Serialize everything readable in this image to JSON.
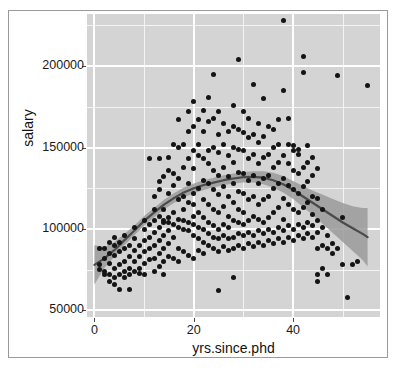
{
  "chart_data": {
    "type": "scatter",
    "title": "",
    "xlabel": "yrs.since.phd",
    "ylabel": "salary",
    "xlim": [
      -1.5,
      57.5
    ],
    "ylim": [
      46000,
      232000
    ],
    "xticks": [
      0,
      20,
      40
    ],
    "xticklabels": [
      "0",
      "20",
      "40"
    ],
    "yticks": [
      50000,
      100000,
      150000,
      200000
    ],
    "yticklabels": [
      "50000",
      "100000",
      "150000",
      "200000"
    ],
    "xminor": [
      10,
      30,
      50
    ],
    "yminor": [
      75000,
      125000,
      175000,
      225000
    ],
    "grid": true,
    "legend": "none",
    "panel_background": "#d4d4d4",
    "grid_color": "#ffffff",
    "point_color": "#141414",
    "smooth_line_color": "#4a4a4a",
    "smooth_band_color": "#9a9a9a",
    "smooth_method": "loess",
    "points": [
      [
        1,
        88000
      ],
      [
        1,
        78000
      ],
      [
        1,
        75000
      ],
      [
        2,
        74000
      ],
      [
        2,
        82000
      ],
      [
        2,
        72000
      ],
      [
        2,
        88000
      ],
      [
        3,
        72000
      ],
      [
        3,
        79000
      ],
      [
        3,
        85000
      ],
      [
        3,
        92000
      ],
      [
        3,
        68000
      ],
      [
        4,
        70000
      ],
      [
        4,
        76000
      ],
      [
        4,
        84000
      ],
      [
        4,
        90000
      ],
      [
        4,
        95000
      ],
      [
        4,
        66000
      ],
      [
        5,
        72000
      ],
      [
        5,
        78000
      ],
      [
        5,
        86000
      ],
      [
        5,
        92000
      ],
      [
        5,
        63000
      ],
      [
        6,
        74000
      ],
      [
        6,
        80000
      ],
      [
        6,
        88000
      ],
      [
        6,
        96000
      ],
      [
        6,
        70000
      ],
      [
        7,
        76000
      ],
      [
        7,
        83000
      ],
      [
        7,
        90000
      ],
      [
        7,
        72000
      ],
      [
        7,
        63000
      ],
      [
        8,
        74000
      ],
      [
        8,
        80000
      ],
      [
        8,
        87000
      ],
      [
        8,
        94000
      ],
      [
        8,
        101000
      ],
      [
        9,
        76000
      ],
      [
        9,
        83000
      ],
      [
        9,
        90000
      ],
      [
        9,
        73000
      ],
      [
        10,
        79000
      ],
      [
        10,
        86000
      ],
      [
        10,
        93000
      ],
      [
        10,
        100000
      ],
      [
        10,
        105000
      ],
      [
        10,
        72000
      ],
      [
        11,
        81000
      ],
      [
        11,
        88000
      ],
      [
        11,
        95000
      ],
      [
        11,
        103000
      ],
      [
        11,
        143000
      ],
      [
        12,
        74000
      ],
      [
        12,
        82000
      ],
      [
        12,
        90000
      ],
      [
        12,
        98000
      ],
      [
        12,
        105000
      ],
      [
        12,
        112000
      ],
      [
        12,
        120000
      ],
      [
        13,
        77000
      ],
      [
        13,
        85000
      ],
      [
        13,
        93000
      ],
      [
        13,
        101000
      ],
      [
        13,
        108000
      ],
      [
        13,
        124000
      ],
      [
        13,
        129000
      ],
      [
        13,
        143000
      ],
      [
        14,
        72000
      ],
      [
        14,
        80000
      ],
      [
        14,
        88000
      ],
      [
        14,
        96000
      ],
      [
        14,
        104000
      ],
      [
        14,
        112000
      ],
      [
        14,
        105000
      ],
      [
        14,
        132000
      ],
      [
        15,
        83000
      ],
      [
        15,
        91000
      ],
      [
        15,
        99000
      ],
      [
        15,
        107000
      ],
      [
        15,
        104000
      ],
      [
        15,
        122000
      ],
      [
        15,
        136000
      ],
      [
        15,
        144000
      ],
      [
        16,
        82000
      ],
      [
        16,
        95000
      ],
      [
        16,
        103000
      ],
      [
        16,
        110000
      ],
      [
        16,
        127000
      ],
      [
        16,
        134000
      ],
      [
        16,
        152000
      ],
      [
        17,
        80000
      ],
      [
        17,
        88000
      ],
      [
        17,
        101000
      ],
      [
        17,
        106000
      ],
      [
        17,
        118000
      ],
      [
        17,
        131000
      ],
      [
        17,
        150000
      ],
      [
        17,
        167000
      ],
      [
        18,
        86000
      ],
      [
        18,
        100000
      ],
      [
        18,
        105000
      ],
      [
        18,
        112000
      ],
      [
        18,
        120000
      ],
      [
        18,
        138000
      ],
      [
        18,
        152000
      ],
      [
        19,
        84000
      ],
      [
        19,
        99000
      ],
      [
        19,
        104000
      ],
      [
        19,
        116000
      ],
      [
        19,
        128000
      ],
      [
        19,
        143000
      ],
      [
        19,
        160000
      ],
      [
        19,
        172000
      ],
      [
        20,
        82000
      ],
      [
        20,
        96000
      ],
      [
        20,
        103000
      ],
      [
        20,
        108000
      ],
      [
        20,
        115000
      ],
      [
        20,
        122000
      ],
      [
        20,
        137000
      ],
      [
        20,
        148000
      ],
      [
        20,
        163000
      ],
      [
        20,
        178000
      ],
      [
        21,
        87000
      ],
      [
        21,
        94000
      ],
      [
        21,
        101000
      ],
      [
        21,
        110000
      ],
      [
        21,
        125000
      ],
      [
        21,
        145000
      ],
      [
        21,
        152000
      ],
      [
        21,
        167000
      ],
      [
        22,
        85000
      ],
      [
        22,
        92000
      ],
      [
        22,
        100000
      ],
      [
        22,
        107000
      ],
      [
        22,
        118000
      ],
      [
        22,
        130000
      ],
      [
        22,
        143000
      ],
      [
        22,
        160000
      ],
      [
        22,
        173000
      ],
      [
        23,
        90000
      ],
      [
        23,
        97000
      ],
      [
        23,
        104000
      ],
      [
        23,
        115000
      ],
      [
        23,
        128000
      ],
      [
        23,
        140000
      ],
      [
        23,
        148000
      ],
      [
        23,
        166000
      ],
      [
        23,
        181000
      ],
      [
        24,
        88000
      ],
      [
        24,
        95000
      ],
      [
        24,
        102000
      ],
      [
        24,
        112000
      ],
      [
        24,
        124000
      ],
      [
        24,
        136000
      ],
      [
        24,
        150000
      ],
      [
        24,
        168000
      ],
      [
        24,
        195000
      ],
      [
        25,
        62000
      ],
      [
        25,
        86000
      ],
      [
        25,
        94000
      ],
      [
        25,
        100000
      ],
      [
        25,
        110000
      ],
      [
        25,
        121000
      ],
      [
        25,
        133000
      ],
      [
        25,
        147000
      ],
      [
        25,
        158000
      ],
      [
        25,
        172000
      ],
      [
        26,
        89000
      ],
      [
        26,
        96000
      ],
      [
        26,
        103000
      ],
      [
        26,
        114000
      ],
      [
        26,
        126000
      ],
      [
        26,
        138000
      ],
      [
        26,
        152000
      ],
      [
        26,
        165000
      ],
      [
        27,
        87000
      ],
      [
        27,
        94000
      ],
      [
        27,
        101000
      ],
      [
        27,
        108000
      ],
      [
        27,
        120000
      ],
      [
        27,
        132000
      ],
      [
        27,
        145000
      ],
      [
        27,
        160000
      ],
      [
        28,
        70000
      ],
      [
        28,
        88000
      ],
      [
        28,
        95000
      ],
      [
        28,
        105000
      ],
      [
        28,
        116000
      ],
      [
        28,
        128000
      ],
      [
        28,
        141000
      ],
      [
        28,
        150000
      ],
      [
        28,
        163000
      ],
      [
        28,
        176000
      ],
      [
        29,
        90000
      ],
      [
        29,
        97000
      ],
      [
        29,
        104000
      ],
      [
        29,
        112000
      ],
      [
        29,
        123000
      ],
      [
        29,
        135000
      ],
      [
        29,
        149000
      ],
      [
        29,
        161000
      ],
      [
        29,
        204000
      ],
      [
        30,
        88000
      ],
      [
        30,
        96000
      ],
      [
        30,
        103000
      ],
      [
        30,
        110000
      ],
      [
        30,
        122000
      ],
      [
        30,
        134000
      ],
      [
        30,
        148000
      ],
      [
        30,
        159000
      ],
      [
        30,
        172000
      ],
      [
        31,
        91000
      ],
      [
        31,
        98000
      ],
      [
        31,
        105000
      ],
      [
        31,
        118000
      ],
      [
        31,
        130000
      ],
      [
        31,
        143000
      ],
      [
        31,
        156000
      ],
      [
        31,
        168000
      ],
      [
        32,
        89000
      ],
      [
        32,
        96000
      ],
      [
        32,
        108000
      ],
      [
        32,
        120000
      ],
      [
        32,
        133000
      ],
      [
        32,
        146000
      ],
      [
        32,
        158000
      ],
      [
        32,
        189000
      ],
      [
        33,
        92000
      ],
      [
        33,
        99000
      ],
      [
        33,
        106000
      ],
      [
        33,
        115000
      ],
      [
        33,
        128000
      ],
      [
        33,
        140000
      ],
      [
        33,
        153000
      ],
      [
        33,
        165000
      ],
      [
        34,
        90000
      ],
      [
        34,
        97000
      ],
      [
        34,
        104000
      ],
      [
        34,
        118000
      ],
      [
        34,
        131000
      ],
      [
        34,
        144000
      ],
      [
        34,
        157000
      ],
      [
        34,
        180000
      ],
      [
        35,
        93000
      ],
      [
        35,
        100000
      ],
      [
        35,
        107000
      ],
      [
        35,
        120000
      ],
      [
        35,
        133000
      ],
      [
        35,
        146000
      ],
      [
        35,
        163000
      ],
      [
        36,
        91000
      ],
      [
        36,
        98000
      ],
      [
        36,
        110000
      ],
      [
        36,
        125000
      ],
      [
        36,
        138000
      ],
      [
        36,
        150000
      ],
      [
        36,
        161000
      ],
      [
        37,
        94000
      ],
      [
        37,
        101000
      ],
      [
        37,
        113000
      ],
      [
        37,
        128000
      ],
      [
        37,
        141000
      ],
      [
        37,
        152000
      ],
      [
        37,
        167000
      ],
      [
        38,
        92000
      ],
      [
        38,
        99000
      ],
      [
        38,
        106000
      ],
      [
        38,
        119000
      ],
      [
        38,
        131000
      ],
      [
        38,
        145000
      ],
      [
        38,
        185000
      ],
      [
        38,
        228000
      ],
      [
        39,
        95000
      ],
      [
        39,
        102000
      ],
      [
        39,
        115000
      ],
      [
        39,
        127000
      ],
      [
        39,
        140000
      ],
      [
        39,
        152000
      ],
      [
        39,
        168000
      ],
      [
        40,
        93000
      ],
      [
        40,
        100000
      ],
      [
        40,
        112000
      ],
      [
        40,
        124000
      ],
      [
        40,
        136000
      ],
      [
        40,
        148000
      ],
      [
        40,
        151000
      ],
      [
        41,
        96000
      ],
      [
        41,
        103000
      ],
      [
        41,
        110000
      ],
      [
        41,
        122000
      ],
      [
        41,
        134000
      ],
      [
        41,
        146000
      ],
      [
        41,
        149000
      ],
      [
        42,
        94000
      ],
      [
        42,
        101000
      ],
      [
        42,
        113000
      ],
      [
        42,
        126000
      ],
      [
        42,
        138000
      ],
      [
        42,
        196000
      ],
      [
        42,
        206000
      ],
      [
        43,
        97000
      ],
      [
        43,
        104000
      ],
      [
        43,
        116000
      ],
      [
        43,
        129000
      ],
      [
        43,
        141000
      ],
      [
        43,
        151000
      ],
      [
        44,
        95000
      ],
      [
        44,
        102000
      ],
      [
        44,
        109000
      ],
      [
        44,
        120000
      ],
      [
        44,
        133000
      ],
      [
        44,
        144000
      ],
      [
        45,
        72000
      ],
      [
        45,
        68000
      ],
      [
        45,
        88000
      ],
      [
        45,
        98000
      ],
      [
        45,
        105000
      ],
      [
        45,
        119000
      ],
      [
        45,
        137000
      ],
      [
        46,
        76000
      ],
      [
        46,
        90000
      ],
      [
        46,
        101000
      ],
      [
        46,
        112000
      ],
      [
        47,
        72000
      ],
      [
        47,
        88000
      ],
      [
        47,
        96000
      ],
      [
        48,
        85000
      ],
      [
        48,
        91000
      ],
      [
        49,
        88000
      ],
      [
        49,
        194000
      ],
      [
        50,
        78000
      ],
      [
        50,
        107000
      ],
      [
        51,
        58000
      ],
      [
        52,
        78000
      ],
      [
        53,
        80000
      ],
      [
        55,
        188000
      ]
    ],
    "smooth_fit": [
      [
        0,
        78000
      ],
      [
        2,
        82000
      ],
      [
        4,
        87000
      ],
      [
        6,
        93000
      ],
      [
        8,
        99000
      ],
      [
        10,
        105000
      ],
      [
        12,
        110000
      ],
      [
        14,
        115000
      ],
      [
        16,
        119000
      ],
      [
        18,
        122500
      ],
      [
        20,
        125000
      ],
      [
        22,
        127000
      ],
      [
        24,
        128500
      ],
      [
        26,
        130000
      ],
      [
        28,
        131000
      ],
      [
        30,
        131800
      ],
      [
        32,
        132000
      ],
      [
        34,
        131500
      ],
      [
        36,
        130000
      ],
      [
        38,
        127500
      ],
      [
        40,
        124000
      ],
      [
        42,
        120000
      ],
      [
        44,
        116000
      ],
      [
        46,
        112000
      ],
      [
        48,
        108000
      ],
      [
        50,
        104000
      ],
      [
        52,
        100500
      ],
      [
        54,
        97000
      ],
      [
        55,
        95000
      ]
    ],
    "smooth_ci_lower": [
      [
        0,
        66000
      ],
      [
        2,
        76000
      ],
      [
        4,
        83000
      ],
      [
        6,
        90000
      ],
      [
        8,
        96000
      ],
      [
        10,
        102000
      ],
      [
        12,
        107000
      ],
      [
        14,
        112000
      ],
      [
        16,
        116000
      ],
      [
        18,
        119500
      ],
      [
        20,
        122000
      ],
      [
        22,
        124000
      ],
      [
        24,
        125500
      ],
      [
        26,
        127000
      ],
      [
        28,
        128000
      ],
      [
        30,
        128500
      ],
      [
        32,
        128500
      ],
      [
        34,
        127500
      ],
      [
        36,
        125500
      ],
      [
        38,
        122500
      ],
      [
        40,
        118500
      ],
      [
        42,
        113500
      ],
      [
        44,
        108500
      ],
      [
        46,
        103000
      ],
      [
        48,
        97500
      ],
      [
        50,
        92000
      ],
      [
        52,
        86500
      ],
      [
        54,
        81000
      ],
      [
        55,
        77000
      ]
    ],
    "smooth_ci_upper": [
      [
        0,
        90000
      ],
      [
        2,
        89000
      ],
      [
        4,
        92000
      ],
      [
        6,
        97000
      ],
      [
        8,
        102000
      ],
      [
        10,
        108000
      ],
      [
        12,
        113000
      ],
      [
        14,
        118000
      ],
      [
        16,
        122000
      ],
      [
        18,
        125500
      ],
      [
        20,
        128000
      ],
      [
        22,
        130000
      ],
      [
        24,
        131500
      ],
      [
        26,
        133000
      ],
      [
        28,
        134000
      ],
      [
        30,
        135000
      ],
      [
        32,
        135500
      ],
      [
        34,
        135500
      ],
      [
        36,
        134500
      ],
      [
        38,
        132500
      ],
      [
        40,
        129500
      ],
      [
        42,
        126500
      ],
      [
        44,
        123500
      ],
      [
        46,
        121000
      ],
      [
        48,
        118500
      ],
      [
        50,
        116000
      ],
      [
        52,
        114000
      ],
      [
        54,
        113000
      ],
      [
        55,
        113000
      ]
    ]
  }
}
